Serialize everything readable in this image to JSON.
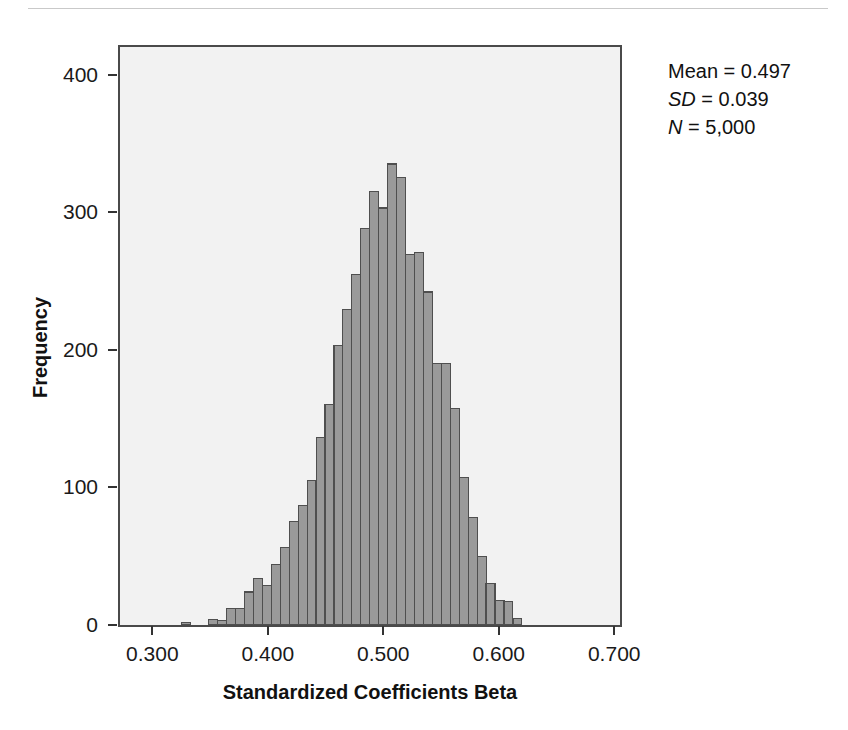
{
  "chart_data": {
    "type": "bar",
    "title": "",
    "xlabel": "Standardized Coefficients Beta",
    "ylabel": "Frequency",
    "xlim": [
      0.272,
      0.705
    ],
    "ylim": [
      0,
      420
    ],
    "xticks": [
      "0.300",
      "0.400",
      "0.500",
      "0.600",
      "0.700"
    ],
    "xtick_values": [
      0.3,
      0.4,
      0.5,
      0.6,
      0.7
    ],
    "yticks": [
      "0",
      "100",
      "200",
      "300",
      "400"
    ],
    "ytick_values": [
      0,
      100,
      200,
      300,
      400
    ],
    "grid": false,
    "legend": "none",
    "bin_width": 0.00775,
    "bin_starts": [
      0.3255,
      0.3333,
      0.341,
      0.3488,
      0.3565,
      0.3643,
      0.372,
      0.3798,
      0.3875,
      0.3953,
      0.403,
      0.4108,
      0.4185,
      0.4263,
      0.434,
      0.4418,
      0.4495,
      0.4573,
      0.465,
      0.4728,
      0.4805,
      0.4883,
      0.496,
      0.5038,
      0.5115,
      0.5193,
      0.527,
      0.5348,
      0.5425,
      0.5503,
      0.558,
      0.5658,
      0.5735,
      0.5813,
      0.589,
      0.5968,
      0.6045,
      0.6123
    ],
    "values": [
      2,
      0,
      0,
      4,
      3,
      12,
      12,
      24,
      34,
      29,
      44,
      56,
      75,
      87,
      105,
      136,
      160,
      203,
      229,
      255,
      288,
      315,
      303,
      335,
      325,
      269,
      271,
      242,
      190,
      190,
      157,
      107,
      78,
      50,
      30,
      18,
      17,
      5
    ]
  },
  "axes": {
    "x": {
      "label": "Standardized Coefficients Beta",
      "ticks": [
        "0.300",
        "0.400",
        "0.500",
        "0.600",
        "0.700"
      ]
    },
    "y": {
      "label": "Frequency",
      "ticks": [
        "0",
        "100",
        "200",
        "300",
        "400"
      ]
    }
  },
  "stats": {
    "mean_label": "Mean",
    "mean_value": "0.497",
    "sd_label": "SD",
    "sd_value": "0.039",
    "n_label": "N",
    "n_value": "5,000",
    "eq": "=",
    "mean_line": "Mean = 0.497",
    "sd_line": "SD = 0.039",
    "n_line": "N = 5,000"
  },
  "style": {
    "bar_fill": "#9a9a9a",
    "bar_stroke": "#4f4f4f",
    "plot_background": "#f2f2f2",
    "frame_color": "#4a4a4a",
    "text_color": "#1a1a1a"
  }
}
